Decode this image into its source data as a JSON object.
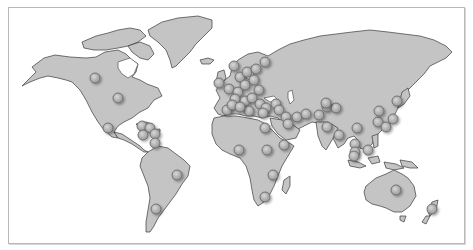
{
  "map": {
    "type": "world-map",
    "style": "grayscale",
    "colors": {
      "land": "#c4c4c4",
      "coast": "#3a3a3a",
      "water": "#ffffff",
      "frame": "#b8b8b8",
      "marker_fill": "#b0b0b0",
      "marker_stroke": "#6a6a6a"
    },
    "marker_radius": 5,
    "markers": [
      {
        "region": "north-america",
        "x": 95,
        "y": 78
      },
      {
        "region": "north-america",
        "x": 118,
        "y": 98
      },
      {
        "region": "central-america",
        "x": 108,
        "y": 128
      },
      {
        "region": "caribbean",
        "x": 142,
        "y": 126
      },
      {
        "region": "caribbean",
        "x": 150,
        "y": 128
      },
      {
        "region": "caribbean",
        "x": 143,
        "y": 135
      },
      {
        "region": "caribbean",
        "x": 155,
        "y": 134
      },
      {
        "region": "caribbean",
        "x": 155,
        "y": 143
      },
      {
        "region": "south-america",
        "x": 177,
        "y": 175
      },
      {
        "region": "south-america",
        "x": 156,
        "y": 209
      },
      {
        "region": "europe",
        "x": 219,
        "y": 83
      },
      {
        "region": "europe",
        "x": 234,
        "y": 66
      },
      {
        "region": "europe",
        "x": 240,
        "y": 77
      },
      {
        "region": "europe",
        "x": 247,
        "y": 72
      },
      {
        "region": "europe",
        "x": 256,
        "y": 69
      },
      {
        "region": "europe",
        "x": 265,
        "y": 62
      },
      {
        "region": "europe",
        "x": 229,
        "y": 89
      },
      {
        "region": "europe",
        "x": 238,
        "y": 92
      },
      {
        "region": "europe",
        "x": 245,
        "y": 85
      },
      {
        "region": "europe",
        "x": 254,
        "y": 80
      },
      {
        "region": "europe",
        "x": 259,
        "y": 90
      },
      {
        "region": "europe",
        "x": 235,
        "y": 99
      },
      {
        "region": "europe",
        "x": 245,
        "y": 101
      },
      {
        "region": "europe",
        "x": 252,
        "y": 98
      },
      {
        "region": "europe",
        "x": 227,
        "y": 110
      },
      {
        "region": "europe",
        "x": 232,
        "y": 105
      },
      {
        "region": "europe",
        "x": 249,
        "y": 111
      },
      {
        "region": "europe",
        "x": 260,
        "y": 104
      },
      {
        "region": "europe",
        "x": 266,
        "y": 108
      },
      {
        "region": "europe",
        "x": 276,
        "y": 104
      },
      {
        "region": "europe",
        "x": 279,
        "y": 110
      },
      {
        "region": "middle-east",
        "x": 240,
        "y": 107
      },
      {
        "region": "middle-east",
        "x": 263,
        "y": 113
      },
      {
        "region": "middle-east",
        "x": 286,
        "y": 117
      },
      {
        "region": "middle-east",
        "x": 297,
        "y": 117
      },
      {
        "region": "middle-east",
        "x": 306,
        "y": 114
      },
      {
        "region": "middle-east",
        "x": 288,
        "y": 124
      },
      {
        "region": "north-africa",
        "x": 265,
        "y": 128
      },
      {
        "region": "africa",
        "x": 239,
        "y": 150
      },
      {
        "region": "africa",
        "x": 267,
        "y": 150
      },
      {
        "region": "africa",
        "x": 284,
        "y": 145
      },
      {
        "region": "africa",
        "x": 273,
        "y": 175
      },
      {
        "region": "africa",
        "x": 265,
        "y": 197
      },
      {
        "region": "south-asia",
        "x": 319,
        "y": 115
      },
      {
        "region": "south-asia",
        "x": 327,
        "y": 107
      },
      {
        "region": "south-asia",
        "x": 336,
        "y": 108
      },
      {
        "region": "south-asia",
        "x": 327,
        "y": 127
      },
      {
        "region": "south-asia",
        "x": 339,
        "y": 135
      },
      {
        "region": "central-asia",
        "x": 326,
        "y": 103
      },
      {
        "region": "east-asia",
        "x": 357,
        "y": 128
      },
      {
        "region": "east-asia",
        "x": 378,
        "y": 122
      },
      {
        "region": "east-asia",
        "x": 386,
        "y": 127
      },
      {
        "region": "east-asia",
        "x": 393,
        "y": 119
      },
      {
        "region": "east-asia",
        "x": 397,
        "y": 101
      },
      {
        "region": "east-asia",
        "x": 379,
        "y": 111
      },
      {
        "region": "southeast-asia",
        "x": 355,
        "y": 144
      },
      {
        "region": "southeast-asia",
        "x": 355,
        "y": 152
      },
      {
        "region": "southeast-asia",
        "x": 368,
        "y": 150
      },
      {
        "region": "southeast-asia",
        "x": 354,
        "y": 156
      },
      {
        "region": "oceania",
        "x": 396,
        "y": 190
      },
      {
        "region": "oceania",
        "x": 432,
        "y": 209
      }
    ]
  }
}
